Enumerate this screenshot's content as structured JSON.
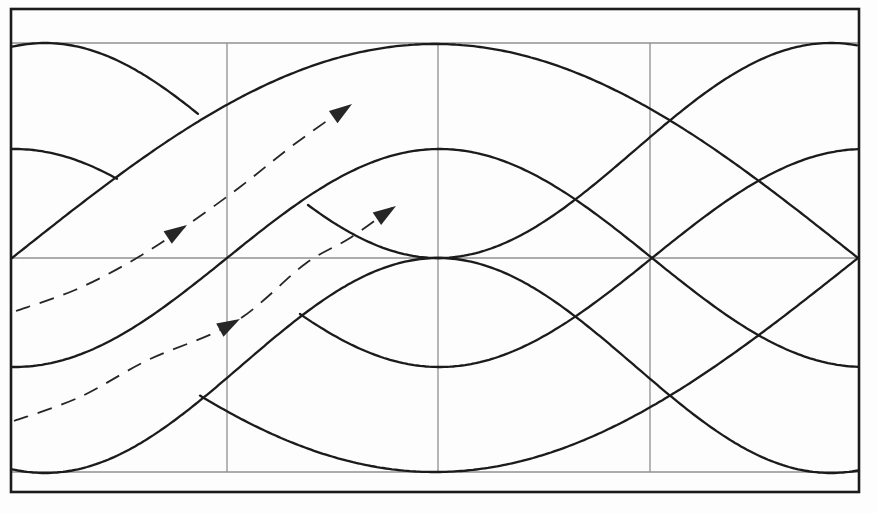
{
  "figure": {
    "canvas": {
      "width": 877,
      "height": 513,
      "background": "#fdfdfd"
    },
    "border": {
      "x": 11,
      "y": 9,
      "width": 848,
      "height": 483,
      "color": "#1b1b1b",
      "stroke_width": 2.6
    },
    "grid": {
      "color": "#909090",
      "stroke_width": 1.3,
      "h_lines": [
        {
          "name": "grid-line-top",
          "y": 43,
          "x1": 12,
          "x2": 858
        },
        {
          "name": "grid-line-middle",
          "y": 258,
          "x1": 12,
          "x2": 858
        },
        {
          "name": "grid-line-bottom",
          "y": 472,
          "x1": 12,
          "x2": 858
        }
      ],
      "v_lines": [
        {
          "name": "grid-line-quarter-1",
          "x": 227,
          "y1": 43,
          "y2": 472
        },
        {
          "name": "grid-line-quarter-2",
          "x": 438,
          "y1": 43,
          "y2": 472
        },
        {
          "name": "grid-line-quarter-3",
          "x": 650,
          "y1": 43,
          "y2": 472
        }
      ]
    },
    "solid_curves": {
      "color": "#1b1b1b",
      "stroke_width": 2.3,
      "items": [
        {
          "name": "large-hump-upper",
          "mid": 258,
          "amp": -214,
          "x0": 12,
          "period": 1692,
          "segments": [
            [
              12,
              858
            ]
          ]
        },
        {
          "name": "large-hump-lower",
          "mid": 258,
          "amp": 214,
          "x0": 12,
          "period": 1692,
          "segments": [
            [
              200,
              858
            ]
          ]
        },
        {
          "name": "small-wave-rising",
          "mid": 258,
          "amp": -109,
          "x0": 227,
          "period": 850,
          "segments": [
            [
              12,
              858
            ]
          ]
        },
        {
          "name": "small-wave-falling",
          "mid": 258,
          "amp": 109,
          "x0": 227,
          "period": 850,
          "segments": [
            [
              12,
              118
            ],
            [
              300,
              858
            ]
          ]
        },
        {
          "name": "s-curve-lower",
          "mid": 365.5,
          "amp": 107.5,
          "x0": -151.5,
          "period": 786,
          "segments": [
            [
              12,
              858
            ]
          ]
        },
        {
          "name": "s-curve-upper",
          "mid": 150.5,
          "amp": -107.5,
          "x0": -151.5,
          "period": 786,
          "segments": [
            [
              12,
              200
            ],
            [
              308,
              858
            ]
          ]
        }
      ]
    },
    "dashed_arrows": {
      "color": "#262626",
      "stroke_width": 1.8,
      "dash": "15 10",
      "head_length": 23,
      "head_width": 15,
      "paths": [
        {
          "name": "trajectory-arrow-upper",
          "points": [
            [
              16,
              311
            ],
            [
              75,
              290
            ],
            [
              130,
              262
            ],
            [
              183,
              228
            ],
            [
              240,
              187
            ],
            [
              292,
              146
            ],
            [
              348,
              106
            ]
          ],
          "heads": [
            {
              "x": 187,
              "y": 225,
              "angle": -33
            },
            {
              "x": 352,
              "y": 104,
              "angle": -35
            }
          ]
        },
        {
          "name": "trajectory-arrow-lower",
          "points": [
            [
              14,
              421
            ],
            [
              80,
              397
            ],
            [
              148,
              360
            ],
            [
              235,
              322
            ],
            [
              305,
              264
            ],
            [
              350,
              238
            ],
            [
              392,
              208
            ]
          ],
          "heads": [
            {
              "x": 240,
              "y": 319,
              "angle": -29
            },
            {
              "x": 396,
              "y": 206,
              "angle": -34
            }
          ]
        }
      ]
    }
  }
}
